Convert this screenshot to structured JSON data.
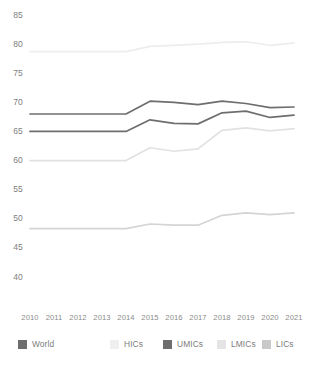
{
  "chart_data": {
    "type": "line",
    "title": "",
    "xlabel": "",
    "ylabel": "",
    "categories": [
      "2010",
      "2011",
      "2012",
      "2013",
      "2014",
      "2015",
      "2016",
      "2017",
      "2018",
      "2019",
      "2020",
      "2021"
    ],
    "ylim": [
      40,
      85
    ],
    "yticks": [
      40,
      45,
      50,
      55,
      60,
      65,
      70,
      75,
      80,
      85
    ],
    "grid": false,
    "legend_position": "bottom",
    "series": [
      {
        "name": "World",
        "color": "#6e6e6e",
        "values": [
          65.0,
          65.0,
          65.0,
          65.0,
          65.0,
          67.0,
          66.4,
          66.3,
          68.2,
          68.5,
          67.4,
          67.8
        ]
      },
      {
        "name": "HICs",
        "color": "#ededed",
        "values": [
          78.7,
          78.7,
          78.7,
          78.7,
          78.7,
          79.6,
          79.8,
          80.0,
          80.3,
          80.4,
          79.8,
          80.2
        ]
      },
      {
        "name": "UMICs",
        "color": "#6e6e6e",
        "values": [
          68.0,
          68.0,
          68.0,
          68.0,
          68.0,
          70.2,
          70.0,
          69.6,
          70.2,
          69.8,
          69.1,
          69.2
        ]
      },
      {
        "name": "LMICs",
        "color": "#e2e2e2",
        "values": [
          60.0,
          60.0,
          60.0,
          60.0,
          60.0,
          62.2,
          61.6,
          62.0,
          65.2,
          65.6,
          65.1,
          65.5
        ]
      },
      {
        "name": "LICs",
        "color": "#d4d4d4",
        "values": [
          48.3,
          48.3,
          48.3,
          48.3,
          48.3,
          49.1,
          48.9,
          48.9,
          50.6,
          51.0,
          50.7,
          51.0
        ]
      }
    ]
  },
  "axis": {
    "y_labels": [
      "85",
      "80",
      "75",
      "70",
      "65",
      "60",
      "55",
      "50",
      "45",
      "40"
    ],
    "x_labels": [
      "2010",
      "2011",
      "2012",
      "2013",
      "2014",
      "2015",
      "2016",
      "2017",
      "2018",
      "2019",
      "2020",
      "2021"
    ]
  },
  "legend": {
    "items": [
      {
        "label": "World",
        "color": "#6e6e6e"
      },
      {
        "label": "HICs",
        "color": "#efefef"
      },
      {
        "label": "UMICs",
        "color": "#6e6e6e"
      },
      {
        "label": "LMICs",
        "color": "#e4e4e4"
      },
      {
        "label": "LICs",
        "color": "#c9c9c9"
      }
    ]
  }
}
